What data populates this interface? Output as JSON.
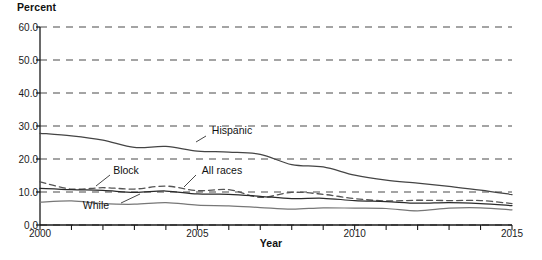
{
  "chart_data": {
    "type": "line",
    "title": "",
    "xlabel": "Year",
    "ylabel": "Percent",
    "xlim": [
      2000,
      2015
    ],
    "ylim": [
      0,
      60
    ],
    "grid": true,
    "grid_style": "dashed-horizontal",
    "legend_position": "inline-annotations",
    "y_ticks": [
      "0.0",
      "10.0",
      "20.0",
      "30.0",
      "40.0",
      "50.0",
      "60.0"
    ],
    "y_tick_values": [
      0,
      10,
      20,
      30,
      40,
      50,
      60
    ],
    "x_ticks": [
      "2000",
      "2005",
      "2010",
      "2015"
    ],
    "x_tick_values": [
      2000,
      2005,
      2010,
      2015
    ],
    "x_minor_ticks": [
      2001,
      2002,
      2003,
      2004,
      2006,
      2007,
      2008,
      2009,
      2011,
      2012,
      2013,
      2014
    ],
    "x": [
      2000,
      2001,
      2002,
      2003,
      2004,
      2005,
      2006,
      2007,
      2008,
      2009,
      2010,
      2011,
      2012,
      2013,
      2014,
      2015
    ],
    "series": [
      {
        "name": "Hispanic",
        "style": "solid",
        "color": "#444444",
        "values": [
          27.8,
          27.0,
          25.7,
          23.5,
          23.8,
          22.4,
          22.1,
          21.4,
          18.3,
          17.6,
          15.1,
          13.6,
          12.7,
          11.7,
          10.6,
          9.2
        ]
      },
      {
        "name": "Block",
        "style": "dashed",
        "color": "#555555",
        "values": [
          13.1,
          10.9,
          11.3,
          10.9,
          11.8,
          10.4,
          10.7,
          8.4,
          9.9,
          9.3,
          8.0,
          7.3,
          7.5,
          7.4,
          7.4,
          6.5
        ]
      },
      {
        "name": "All races",
        "style": "solid",
        "color": "#2a2a2a",
        "values": [
          11.1,
          10.7,
          10.5,
          9.9,
          10.3,
          9.4,
          9.3,
          8.7,
          8.0,
          8.1,
          7.4,
          7.1,
          6.6,
          6.8,
          6.5,
          5.9
        ]
      },
      {
        "name": "While",
        "style": "solid",
        "color": "#777777",
        "values": [
          6.9,
          7.3,
          6.5,
          6.3,
          6.8,
          6.0,
          5.8,
          5.3,
          4.8,
          5.2,
          5.1,
          5.0,
          4.3,
          5.1,
          5.2,
          4.6
        ]
      }
    ],
    "annotations": [
      {
        "text": "Hispanic",
        "label_x": 232,
        "label_y": 130,
        "leader_x1": 206,
        "leader_y1": 136,
        "leader_x2": 196,
        "leader_y2": 142
      },
      {
        "text": "Block",
        "label_x": 126,
        "label_y": 170,
        "leader_x1": 110,
        "leader_y1": 175,
        "leader_x2": 96,
        "leader_y2": 186
      },
      {
        "text": "All races",
        "label_x": 222,
        "label_y": 170,
        "leader_x1": 196,
        "leader_y1": 175,
        "leader_x2": 184,
        "leader_y2": 187
      },
      {
        "text": "While",
        "label_x": 96,
        "label_y": 205,
        "leader_x1": 121,
        "leader_y1": 203,
        "leader_x2": 140,
        "leader_y2": 194
      }
    ]
  },
  "axes": {
    "y_title": "Percent",
    "x_title": "Year"
  },
  "colors": {
    "axis": "#1a1a1a",
    "grid": "#4a4a4a",
    "background": "#ffffff"
  }
}
